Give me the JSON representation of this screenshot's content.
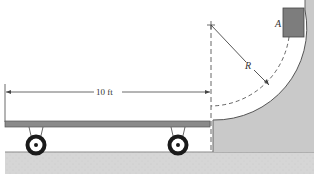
{
  "diagram": {
    "type": "physics-mechanics",
    "labels": {
      "distance": "10 ft",
      "radius": "R",
      "block": "A"
    },
    "colors": {
      "ramp_fill": "#c9c9c9",
      "ground_fill": "#d4d4d4",
      "platform_fill": "#8a8a8a",
      "block_fill": "#7d7d7d",
      "line": "#555555",
      "wheel": "#1a1a1a"
    }
  }
}
